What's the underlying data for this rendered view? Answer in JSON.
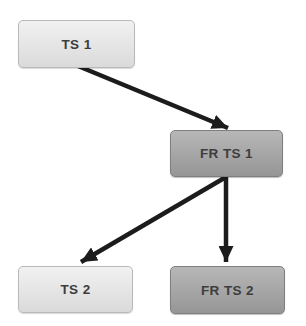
{
  "diagram": {
    "nodes": [
      {
        "id": "ts1",
        "label": "TS 1",
        "x": 18,
        "y": 20,
        "w": 117,
        "h": 48,
        "style": "light"
      },
      {
        "id": "frts1",
        "label": "FR TS 1",
        "x": 170,
        "y": 130,
        "w": 113,
        "h": 47,
        "style": "dark"
      },
      {
        "id": "ts2",
        "label": "TS 2",
        "x": 18,
        "y": 266,
        "w": 115,
        "h": 47,
        "style": "light"
      },
      {
        "id": "frts2",
        "label": "FR TS 2",
        "x": 170,
        "y": 266,
        "w": 115,
        "h": 48,
        "style": "dark"
      }
    ],
    "edges": [
      {
        "from": "ts1",
        "to": "frts1",
        "x1": 78,
        "y1": 66,
        "x2": 228,
        "y2": 128
      },
      {
        "from": "frts1",
        "to": "ts2",
        "x1": 226,
        "y1": 177,
        "x2": 81,
        "y2": 262
      },
      {
        "from": "frts1",
        "to": "frts2",
        "x1": 226,
        "y1": 177,
        "x2": 226,
        "y2": 262
      }
    ],
    "colors": {
      "background": "#ffffff",
      "light_box_top": "#f1f1f1",
      "light_box_bottom": "#dadada",
      "light_box_border": "#b9b9b9",
      "dark_box_top": "#b7b7b7",
      "dark_box_bottom": "#969696",
      "dark_box_border": "#7e7e7e",
      "arrow": "#1c1c1c",
      "text": "#3d3d3d"
    }
  }
}
